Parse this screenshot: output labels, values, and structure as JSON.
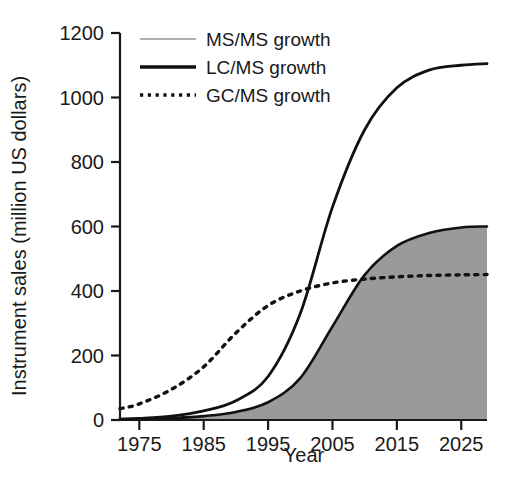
{
  "chart_data": {
    "type": "area",
    "title": "",
    "xlabel": "Year",
    "ylabel": "Instrument sales (million US dollars)",
    "xlim": [
      1972,
      2029
    ],
    "ylim": [
      0,
      1200
    ],
    "xticks": [
      "1975",
      "1985",
      "1995",
      "2005",
      "2015",
      "2025"
    ],
    "xtick_values": [
      1975,
      1985,
      1995,
      2005,
      2015,
      2025
    ],
    "yticks": [
      "0",
      "200",
      "400",
      "600",
      "800",
      "1000",
      "1200"
    ],
    "ytick_values": [
      0,
      200,
      400,
      600,
      800,
      1000,
      1200
    ],
    "grid": false,
    "legend_position": "top-left",
    "x": [
      1972,
      1975,
      1980,
      1985,
      1990,
      1995,
      2000,
      2005,
      2010,
      2015,
      2020,
      2025,
      2029
    ],
    "series": [
      {
        "name": "MS/MS growth",
        "style": "filled-area",
        "fill_color": "#9a9a9a",
        "line_color": "#111111",
        "values": [
          2,
          3,
          6,
          12,
          25,
          55,
          130,
          290,
          450,
          540,
          580,
          597,
          600
        ]
      },
      {
        "name": "LC/MS growth",
        "style": "solid",
        "line_color": "#111111",
        "values": [
          3,
          5,
          12,
          28,
          60,
          135,
          330,
          660,
          900,
          1030,
          1085,
          1100,
          1105
        ]
      },
      {
        "name": "GC/MS growth",
        "style": "dotted",
        "line_color": "#111111",
        "values": [
          35,
          50,
          95,
          165,
          270,
          355,
          400,
          425,
          437,
          444,
          448,
          450,
          451
        ]
      }
    ]
  },
  "legend": {
    "items": [
      {
        "label": "MS/MS growth",
        "swatch": "thin-gray-line"
      },
      {
        "label": "LC/MS growth",
        "swatch": "thick-black-line"
      },
      {
        "label": "GC/MS growth",
        "swatch": "dotted-black-line"
      }
    ]
  },
  "axes": {
    "x_title": "Year",
    "y_title": "Instrument sales (million US dollars)",
    "x_tick_labels": [
      "1975",
      "1985",
      "1995",
      "2005",
      "2015",
      "2025"
    ],
    "y_tick_labels": [
      "0",
      "200",
      "400",
      "600",
      "800",
      "1000",
      "1200"
    ]
  },
  "colors": {
    "area_fill": "#9a9a9a",
    "line": "#111111",
    "legend_gray": "#aeaeae",
    "background": "#ffffff",
    "text": "#1a1a1a"
  }
}
